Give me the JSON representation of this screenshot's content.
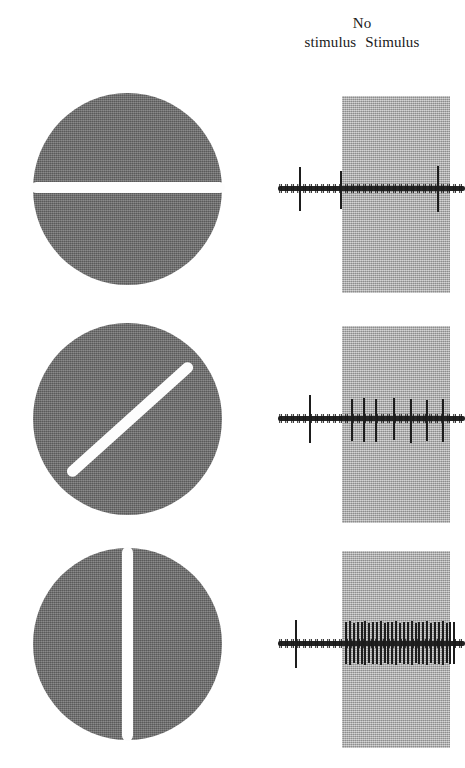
{
  "figure": {
    "title_visible": false,
    "background_color": "#ffffff",
    "width": 465,
    "height": 768
  },
  "header": {
    "no_stimulus_label_line1": "No",
    "no_stimulus_label_line2": "stimulus",
    "stimulus_label": "Stimulus"
  },
  "colors": {
    "disc_gray": "#6f6f6f",
    "stimulus_band_gray": "#b2b2b2",
    "bar_white": "#fdfdfd",
    "trace_black": "#1d1d1d",
    "text_black": "#1a1a1a"
  },
  "chart_data": {
    "type": "line",
    "xlabel": "Time",
    "ylabel": "Extracellular membrane potential (spikes)",
    "grid": false,
    "legend_position": "top",
    "x_regions": [
      {
        "name": "No stimulus",
        "start_pct": 0,
        "end_pct": 34,
        "shaded": false
      },
      {
        "name": "Stimulus",
        "start_pct": 34,
        "end_pct": 92,
        "shaded": true
      }
    ],
    "series": [
      {
        "name": "Horizontal bar (0 degrees)",
        "row": 1,
        "stimulus_orientation_deg": 0,
        "spike_count_no_stimulus": 2,
        "spike_count_stimulus": 1,
        "response_level": "none",
        "spikes_pct": [
          11.5,
          33.5,
          85.0
        ],
        "spike_amplitudes": [
          1.0,
          0.82,
          1.0
        ]
      },
      {
        "name": "Oblique bar (45 degrees)",
        "row": 2,
        "stimulus_orientation_deg": 45,
        "spike_count_no_stimulus": 1,
        "spike_count_stimulus": 7,
        "response_level": "moderate",
        "spikes_pct": [
          16.5,
          39.0,
          45.5,
          52.0,
          61.5,
          70.5,
          79.0,
          87.5
        ],
        "spike_amplitudes": [
          1.0,
          0.92,
          0.95,
          0.88,
          0.92,
          0.9,
          0.86,
          0.9
        ]
      },
      {
        "name": "Vertical bar (90 degrees)",
        "row": 3,
        "stimulus_orientation_deg": 90,
        "spike_count_no_stimulus": 1,
        "spike_count_stimulus": 30,
        "response_level": "vigorous",
        "spikes_pct": [
          9.0,
          36.0,
          38.0,
          40.0,
          42.0,
          44.2,
          46.2,
          48.2,
          50.3,
          52.3,
          54.4,
          56.5,
          58.5,
          60.6,
          62.7,
          64.8,
          66.8,
          68.9,
          71.0,
          73.0,
          75.1,
          77.2,
          79.2,
          81.3,
          83.4,
          85.4,
          87.5,
          89.6,
          91.6,
          93.7
        ],
        "spike_amplitudes": [
          1.0,
          0.9,
          0.95,
          0.88,
          0.93,
          0.9,
          0.95,
          0.87,
          0.92,
          0.9,
          0.95,
          0.88,
          0.93,
          0.9,
          0.94,
          0.89,
          0.93,
          0.9,
          0.95,
          0.88,
          0.92,
          0.9,
          0.94,
          0.89,
          0.93,
          0.9,
          0.95,
          0.88,
          0.92,
          0.9
        ]
      }
    ]
  },
  "rows": [
    {
      "id": "row-horizontal",
      "stimulus_name": "horizontal-bar-stimulus",
      "trace_name": "neural-trace-horizontal"
    },
    {
      "id": "row-oblique",
      "stimulus_name": "oblique-bar-stimulus",
      "trace_name": "neural-trace-oblique"
    },
    {
      "id": "row-vertical",
      "stimulus_name": "vertical-bar-stimulus",
      "trace_name": "neural-trace-vertical"
    }
  ]
}
